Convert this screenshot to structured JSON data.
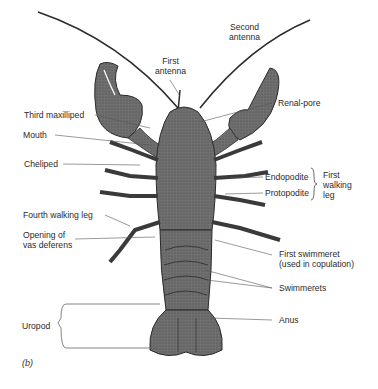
{
  "figure": {
    "panel_label": "(b)",
    "colors": {
      "body": "#6e6e6e",
      "outline": "#2b2b2b",
      "leader": "#555555",
      "text": "#2a2a2a"
    }
  },
  "labels": {
    "first_antenna": {
      "line1": "First",
      "line2": "antenna"
    },
    "second_antenna": {
      "line1": "Second",
      "line2": "antenna"
    },
    "third_maxilliped": "Third maxilliped",
    "renal_pore": "Renal-pore",
    "mouth": "Mouth",
    "cheliped": "Cheliped",
    "endopodite": "Endopodite",
    "protopodite": "Protopodite",
    "first_walking_leg": {
      "line1": "First",
      "line2": "walking",
      "line3": "leg"
    },
    "fourth_walking_leg": "Fourth walking leg",
    "opening_vas_deferens": {
      "line1": "Opening of",
      "line2": "vas deferens"
    },
    "first_swimmeret": {
      "line1": "First swimmeret",
      "line2": "(used in copulation)"
    },
    "swimmerets": "Swimmerets",
    "anus": "Anus",
    "uropod": "Uropod"
  }
}
